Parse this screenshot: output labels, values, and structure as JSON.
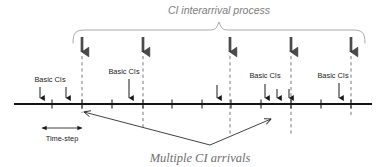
{
  "figure": {
    "type": "timeline-diagram",
    "title_top": "CI interarrival process",
    "title_bottom": "Multiple CI arrivals",
    "timestep_label": "Time-step",
    "basic_ci_labels": [
      {
        "text": "Basic CIs",
        "x": 50,
        "y": 80
      },
      {
        "text": "Basic CIs",
        "x": 124,
        "y": 72
      },
      {
        "text": "Basic CIs",
        "x": 262,
        "y": 76
      },
      {
        "text": "Basic CIs",
        "x": 331,
        "y": 76
      }
    ],
    "colors": {
      "axis": "#1a1a1a",
      "arrow": "#1a1a1a",
      "thick_arrow": "#3c3c3c",
      "dashed": "#585858",
      "brace": "#8c8c8c",
      "title_top": "#7d7d7d",
      "title_bottom": "#6e6e6e",
      "background": "#ffffff"
    },
    "axis": {
      "x_start": 14,
      "x_end": 372,
      "y": 104
    },
    "axis_ticks": [
      52,
      82,
      112,
      143,
      172,
      202,
      231,
      261,
      291,
      321,
      351
    ],
    "dashed_lines_x": [
      82,
      143,
      230,
      291,
      351
    ],
    "thick_arrows_x": [
      82,
      143,
      230,
      291,
      351
    ],
    "thin_arrows_x": [
      40,
      66,
      129,
      217,
      265,
      277,
      289,
      339
    ],
    "brace": {
      "x_left": 73,
      "x_right": 365,
      "y": 30,
      "peak_x": 219
    },
    "timestep_span": {
      "x_left": 42,
      "x_right": 82,
      "y": 128
    },
    "pointer": {
      "vertex_x": 210,
      "vertex_y": 145,
      "left_x": 82,
      "left_y": 112,
      "right_x": 272,
      "right_y": 120
    }
  }
}
